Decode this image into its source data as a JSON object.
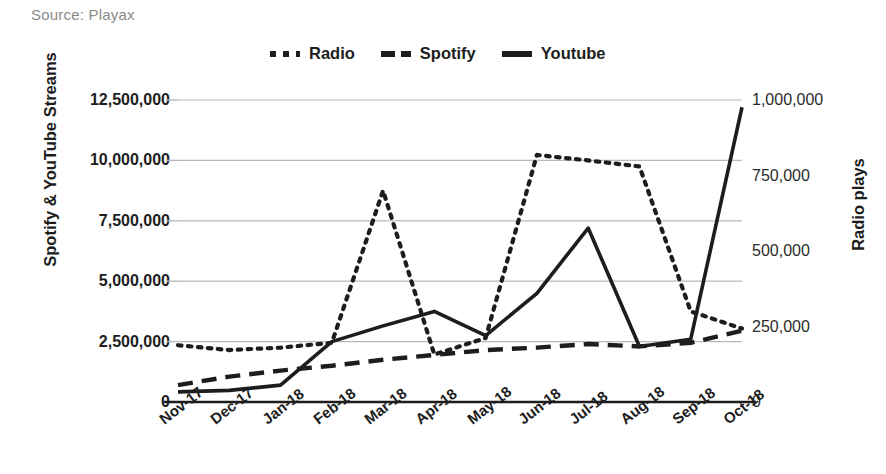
{
  "source_note": "Source: Playax",
  "legend": {
    "position": "top-center",
    "items": [
      {
        "label": "Radio",
        "style": "dotted"
      },
      {
        "label": "Spotify",
        "style": "dashed"
      },
      {
        "label": "Youtube",
        "style": "solid"
      }
    ]
  },
  "chart_data": {
    "type": "line",
    "title": "",
    "subtitle": "",
    "xlabel": "",
    "ylabel": "Spotify & YouTube Streams",
    "y2label": "Radio plays",
    "grid": true,
    "legend_position": "top-center",
    "categories": [
      "Nov-17",
      "Dec-17",
      "Jan-18",
      "Feb-18",
      "Mar-18",
      "Apr-18",
      "May-18",
      "Jun-18",
      "Jul-18",
      "Aug-18",
      "Sep-18",
      "Oct-18"
    ],
    "ylim": [
      0,
      12500000
    ],
    "yticks": [
      "0",
      "2,500,000",
      "5,000,000",
      "7,500,000",
      "10,000,000",
      "12,500,000"
    ],
    "ytick_values": [
      0,
      2500000,
      5000000,
      7500000,
      10000000,
      12500000
    ],
    "y2lim": [
      0,
      1000000
    ],
    "y2ticks": [
      "0",
      "250,000",
      "500,000",
      "750,000",
      "1,000,000"
    ],
    "y2tick_values": [
      0,
      250000,
      500000,
      750000,
      1000000
    ],
    "series": [
      {
        "name": "Radio",
        "style": "dotted",
        "axis": "right",
        "unit": "radio plays",
        "values": [
          188000,
          172000,
          180000,
          196000,
          700000,
          157000,
          212000,
          818000,
          800000,
          780000,
          300000,
          243000
        ]
      },
      {
        "name": "Spotify",
        "style": "dashed",
        "axis": "left",
        "unit": "streams",
        "values": [
          700000,
          1050000,
          1300000,
          1500000,
          1750000,
          1950000,
          2150000,
          2250000,
          2400000,
          2300000,
          2450000,
          2950000
        ]
      },
      {
        "name": "Youtube",
        "style": "solid",
        "axis": "left",
        "unit": "streams",
        "values": [
          420000,
          480000,
          700000,
          2500000,
          3150000,
          3750000,
          2750000,
          4500000,
          7200000,
          2300000,
          2600000,
          12200000
        ]
      }
    ],
    "colors": {
      "line": "#1d1d1d",
      "grid": "#b9b9b9",
      "axis": "#1d1d1d",
      "source_text": "#8a8a8a",
      "background": "#ffffff"
    }
  }
}
